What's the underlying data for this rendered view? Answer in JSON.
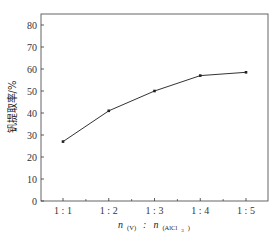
{
  "chart_data": {
    "type": "line",
    "title": "",
    "xlabel": "n(V) : n(AlCl3)",
    "xlabel_parts": {
      "n1": "n",
      "sub1": "(V)",
      "sep": ":",
      "n2": "n",
      "sub2": "(AlCl",
      "sub2_sub": "3",
      "sub2_close": ")"
    },
    "ylabel": "钒提取率/%",
    "categories": [
      "1 : 1",
      "1 : 2",
      "1 : 3",
      "1 : 4",
      "1 : 5"
    ],
    "series": [
      {
        "name": "钒提取率",
        "values": [
          27,
          41,
          50,
          57,
          58.5
        ]
      }
    ],
    "ylim": [
      0,
      85
    ],
    "yticks": [
      0,
      10,
      20,
      30,
      40,
      50,
      60,
      70,
      80
    ],
    "grid": false,
    "legend": null,
    "colors": {
      "line": "#333333",
      "axis": "#333333",
      "frame": "#555555"
    }
  }
}
